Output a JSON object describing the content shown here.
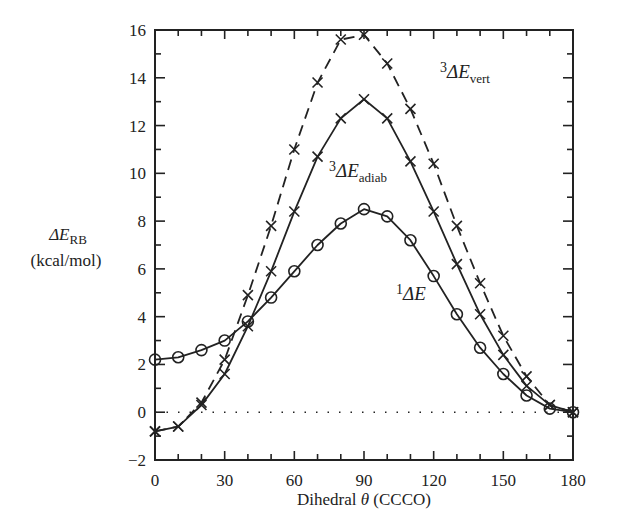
{
  "chart_data": {
    "type": "line",
    "title": "",
    "xlabel": "Dihedral θ (CCCO)",
    "xlabel_parts": {
      "prefix": "Dihedral ",
      "symbol": "θ",
      "suffix": " (CCCO)"
    },
    "ylabel": "ΔE_RB (kcal/mol)",
    "ylabel_parts": {
      "symbol": "ΔE",
      "subscript": "RB",
      "unit": "(kcal/mol)"
    },
    "xlim": [
      0,
      180
    ],
    "ylim": [
      -2,
      16
    ],
    "x_ticks": [
      0,
      30,
      60,
      90,
      120,
      150,
      180
    ],
    "x_minor_step": 10,
    "y_ticks": [
      -2,
      0,
      2,
      4,
      6,
      8,
      10,
      12,
      14,
      16
    ],
    "y_minor_step": 1,
    "y_tick_labels": [
      "−2",
      "0",
      "2",
      "4",
      "6",
      "8",
      "10",
      "12",
      "14",
      "16"
    ],
    "grid": false,
    "legend": "inline labels",
    "reference_line": {
      "y": 0,
      "style": "dotted"
    },
    "x": [
      0,
      10,
      20,
      30,
      40,
      50,
      60,
      70,
      80,
      90,
      100,
      110,
      120,
      130,
      140,
      150,
      160,
      170,
      180
    ],
    "series": [
      {
        "name": "3ΔE_vert",
        "label": {
          "sup": "3",
          "main": "ΔE",
          "sub": "vert"
        },
        "marker": "x",
        "line": "dashed",
        "values": [
          -0.8,
          -0.6,
          0.4,
          2.2,
          4.9,
          7.8,
          11.0,
          13.8,
          15.6,
          15.8,
          14.6,
          12.7,
          10.4,
          7.8,
          5.4,
          3.2,
          1.5,
          0.3,
          0.0
        ]
      },
      {
        "name": "3ΔE_adiab",
        "label": {
          "sup": "3",
          "main": "ΔE",
          "sub": "adiab"
        },
        "marker": "x",
        "line": "solid",
        "values": [
          -0.8,
          -0.6,
          0.3,
          1.6,
          3.6,
          5.9,
          8.4,
          10.7,
          12.3,
          13.1,
          12.3,
          10.5,
          8.4,
          6.2,
          4.1,
          2.4,
          1.1,
          0.3,
          0.0
        ]
      },
      {
        "name": "1ΔE",
        "label": {
          "sup": "1",
          "main": "ΔE",
          "sub": ""
        },
        "marker": "o",
        "line": "solid",
        "values": [
          2.2,
          2.3,
          2.6,
          3.0,
          3.8,
          4.8,
          5.9,
          7.0,
          7.9,
          8.5,
          8.2,
          7.2,
          5.7,
          4.1,
          2.7,
          1.6,
          0.7,
          0.15,
          0.0
        ]
      }
    ]
  },
  "colors": {
    "ink": "#222222",
    "background": "#ffffff"
  }
}
